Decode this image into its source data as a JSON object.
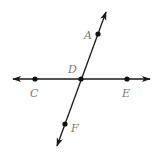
{
  "diagram": {
    "colors": {
      "line": "#1a1a1a",
      "point": "#111111",
      "label": "#7a7a7a",
      "background": "#ffffff"
    },
    "lines": [
      {
        "id": "line-ce",
        "x1": 13,
        "y1": 79,
        "x2": 150,
        "y2": 79,
        "arrows": "both"
      },
      {
        "id": "line-af",
        "x1": 106,
        "y1": 12,
        "x2": 57,
        "y2": 146,
        "arrows": "both"
      }
    ],
    "points": [
      {
        "name": "A",
        "x": 98,
        "y": 34,
        "label_x": 84,
        "label_y": 39
      },
      {
        "name": "C",
        "x": 35,
        "y": 79,
        "label_x": 30,
        "label_y": 97
      },
      {
        "name": "D",
        "x": 81,
        "y": 79,
        "label_x": 68,
        "label_y": 73
      },
      {
        "name": "E",
        "x": 127,
        "y": 79,
        "label_x": 122,
        "label_y": 97
      },
      {
        "name": "F",
        "x": 65,
        "y": 124,
        "label_x": 71,
        "label_y": 132
      }
    ],
    "labels": {
      "A": "A",
      "C": "C",
      "D": "D",
      "E": "E",
      "F": "F"
    }
  }
}
